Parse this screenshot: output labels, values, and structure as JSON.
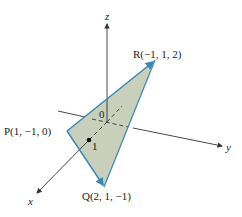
{
  "figure": {
    "type": "3d-coordinate-diagram",
    "axes": {
      "x": {
        "label": "x"
      },
      "y": {
        "label": "y"
      },
      "z": {
        "label": "z"
      },
      "origin_label": "0",
      "tick_label": "1"
    },
    "points": [
      {
        "name": "P",
        "label": "P(1, −1, 0)",
        "coords": [
          1,
          -1,
          0
        ]
      },
      {
        "name": "Q",
        "label": "Q(2, 1, −1)",
        "coords": [
          2,
          1,
          -1
        ]
      },
      {
        "name": "R",
        "label": "R(−1, 1, 2)",
        "coords": [
          -1,
          1,
          2
        ]
      }
    ],
    "colors": {
      "triangle_fill": "#c8cfbb",
      "triangle_edge": "#3a86b5",
      "axis": "#333333"
    }
  }
}
